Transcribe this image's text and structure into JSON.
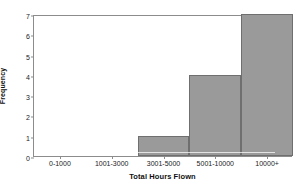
{
  "chart_data": {
    "type": "bar",
    "title": "",
    "xlabel": "Total Hours Flown",
    "ylabel": "Frequency",
    "categories": [
      "0-1000",
      "1001-3000",
      "3001-5000",
      "5001-10000",
      "10000+"
    ],
    "values": [
      0,
      0,
      1,
      4,
      7
    ],
    "ylim": [
      0,
      7
    ],
    "yticks": [
      "0",
      "1",
      "2",
      "3",
      "4",
      "5",
      "6",
      "7"
    ],
    "grid": false,
    "legend": false,
    "bar_color": "#9a9a9a",
    "bar_border_color": "#6f6f6f",
    "axis_color": "#8c8c8c",
    "background": "#ffffff"
  }
}
